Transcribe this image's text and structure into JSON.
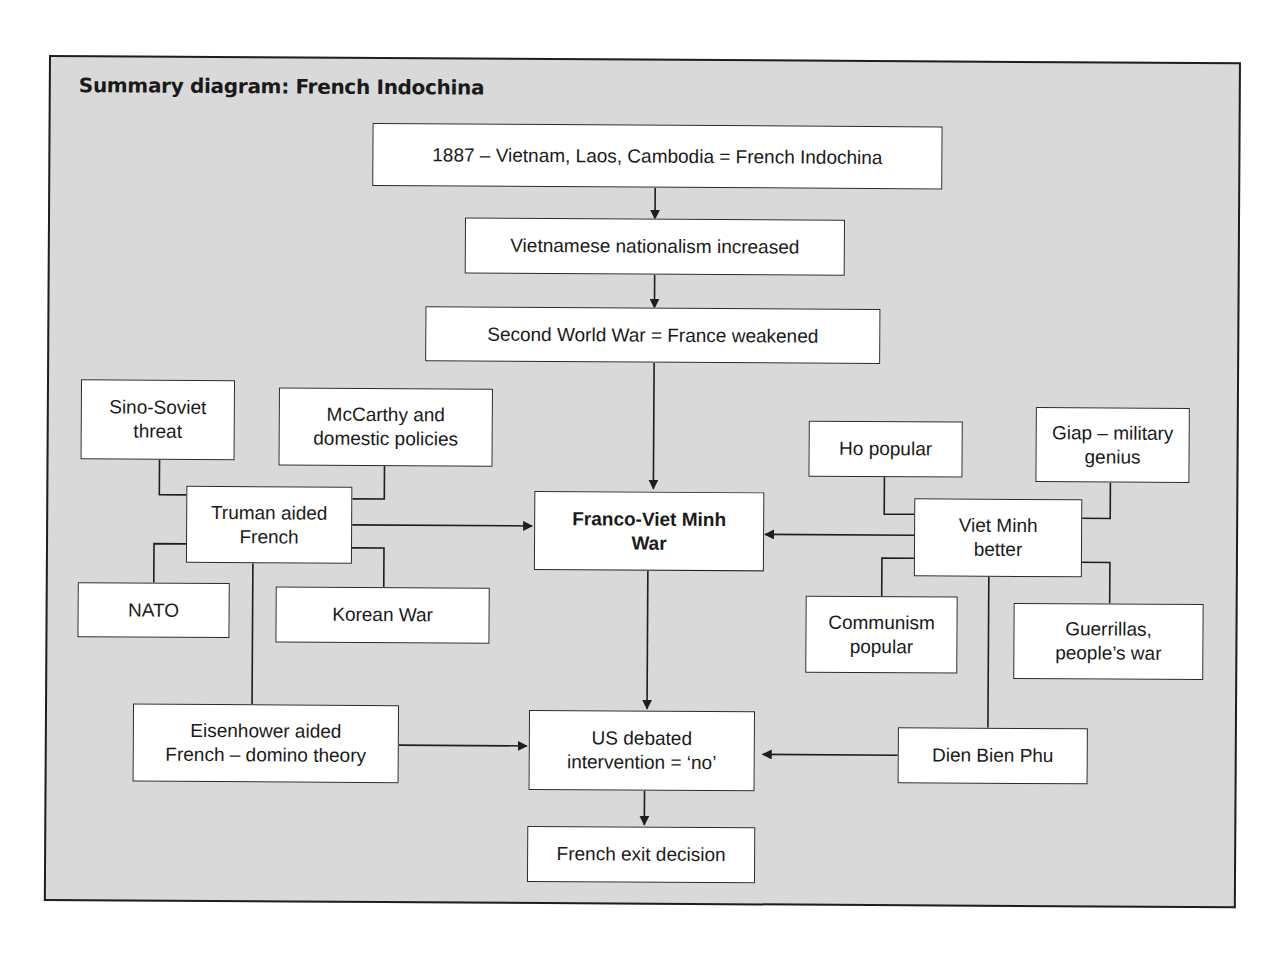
{
  "diagram": {
    "title": "Summary diagram: French Indochina",
    "colors": {
      "background": "#d9d9d9",
      "box_fill": "#ffffff",
      "border": "#2a2a2a"
    },
    "nodes": {
      "n1887": "1887 – Vietnam, Laos, Cambodia = French Indochina",
      "nationalism": "Vietnamese nationalism increased",
      "ww2": "Second World War = France weakened",
      "sino": "Sino-Soviet\nthreat",
      "mccarthy": "McCarthy and\ndomestic policies",
      "truman": "Truman aided\nFrench",
      "nato": "NATO",
      "korea": "Korean War",
      "war": "Franco-Viet Minh\nWar",
      "ho": "Ho popular",
      "giap": "Giap – military\ngenius",
      "vietminh": "Viet Minh\nbetter",
      "communism": "Communism\npopular",
      "guerrillas": "Guerrillas,\npeople’s war",
      "eisenhower": "Eisenhower aided\nFrench – domino theory",
      "usdebate": "US debated\nintervention = ‘no’",
      "dienbienphu": "Dien Bien Phu",
      "exit": "French exit decision"
    },
    "edges": [
      {
        "from": "n1887",
        "to": "nationalism",
        "arrow": true
      },
      {
        "from": "nationalism",
        "to": "ww2",
        "arrow": true
      },
      {
        "from": "ww2",
        "to": "war",
        "arrow": true
      },
      {
        "from": "truman",
        "to": "war",
        "arrow": true
      },
      {
        "from": "vietminh",
        "to": "war",
        "arrow": true
      },
      {
        "from": "war",
        "to": "usdebate",
        "arrow": true
      },
      {
        "from": "eisenhower",
        "to": "usdebate",
        "arrow": true
      },
      {
        "from": "dienbienphu",
        "to": "usdebate",
        "arrow": true
      },
      {
        "from": "usdebate",
        "to": "exit",
        "arrow": true
      },
      {
        "from": "sino",
        "to": "truman",
        "arrow": false
      },
      {
        "from": "mccarthy",
        "to": "truman",
        "arrow": false
      },
      {
        "from": "nato",
        "to": "truman",
        "arrow": false
      },
      {
        "from": "korea",
        "to": "truman",
        "arrow": false
      },
      {
        "from": "truman",
        "to": "eisenhower",
        "arrow": false
      },
      {
        "from": "ho",
        "to": "vietminh",
        "arrow": false
      },
      {
        "from": "giap",
        "to": "vietminh",
        "arrow": false
      },
      {
        "from": "communism",
        "to": "vietminh",
        "arrow": false
      },
      {
        "from": "guerrillas",
        "to": "vietminh",
        "arrow": false
      },
      {
        "from": "vietminh",
        "to": "dienbienphu",
        "arrow": false
      }
    ]
  }
}
